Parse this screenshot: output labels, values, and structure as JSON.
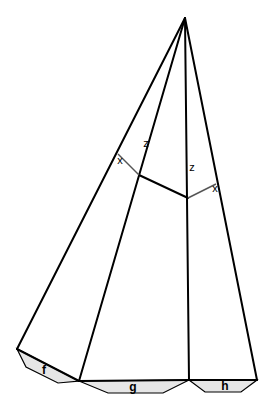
{
  "diagram": {
    "labels": {
      "x_left": "x",
      "z_left": "z",
      "z_right": "z",
      "x_right": "x"
    },
    "tabs": [
      {
        "id": "f",
        "label": "f"
      },
      {
        "id": "g",
        "label": "g"
      },
      {
        "id": "h",
        "label": "h"
      }
    ],
    "colors": {
      "line": "#000000",
      "tab_fill": "#e6e6e6",
      "construction_line": "#555555"
    }
  }
}
